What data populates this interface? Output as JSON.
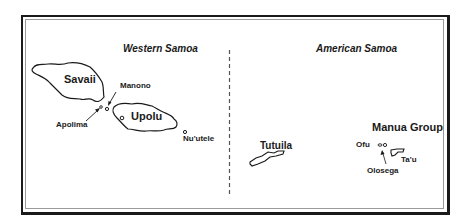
{
  "map": {
    "regions": [
      {
        "name": "Western Samoa"
      },
      {
        "name": "American Samoa"
      }
    ],
    "islands": {
      "savaii": "Savaii",
      "upolu": "Upolu",
      "manono": "Manono",
      "apolima": "Apolima",
      "nuutele": "Nu'utele",
      "tutuila": "Tutuila",
      "manua_group": "Manua Group",
      "ofu": "Ofu",
      "olosega": "Olosega",
      "tau": "Ta'u"
    },
    "colors": {
      "ink": "#1a1a1a",
      "border_inner": "#9a9a9a",
      "background": "#ffffff"
    }
  }
}
